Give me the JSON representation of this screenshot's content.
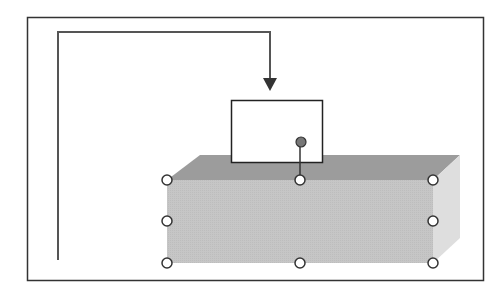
{
  "diagram": {
    "colors": {
      "background": "#ffffff",
      "frame": "#333333",
      "connector": "#555555",
      "box_front": "#c8c8c8",
      "box_top": "#9a9a9a",
      "box_side": "#dcdcdc",
      "handle_fill": "#ffffff",
      "handle_stroke": "#333333",
      "rotate_handle_fill": "#777777"
    },
    "frame": {
      "x": 27,
      "y": 17,
      "width": 457,
      "height": 264
    },
    "connector": {
      "points": [
        [
          58,
          260
        ],
        [
          58,
          32
        ],
        [
          270,
          32
        ],
        [
          270,
          86
        ]
      ],
      "arrowhead": "down"
    },
    "text_box": {
      "x": 231,
      "y": 100,
      "width": 91,
      "height": 62,
      "text": ""
    },
    "box_3d": {
      "front": {
        "x": 167,
        "y": 180,
        "width": 266,
        "height": 83
      },
      "depth_x": 27,
      "depth_y": 25
    },
    "sizing_handles": [
      {
        "id": "top-left",
        "x": 167,
        "y": 180
      },
      {
        "id": "top-center",
        "x": 300,
        "y": 180
      },
      {
        "id": "top-right",
        "x": 433,
        "y": 180
      },
      {
        "id": "middle-left",
        "x": 167,
        "y": 221
      },
      {
        "id": "middle-right",
        "x": 433,
        "y": 221
      },
      {
        "id": "bottom-left",
        "x": 167,
        "y": 263
      },
      {
        "id": "bottom-center",
        "x": 300,
        "y": 263
      },
      {
        "id": "bottom-right",
        "x": 433,
        "y": 263
      }
    ],
    "rotation_handle": {
      "x": 301,
      "y": 142
    }
  }
}
